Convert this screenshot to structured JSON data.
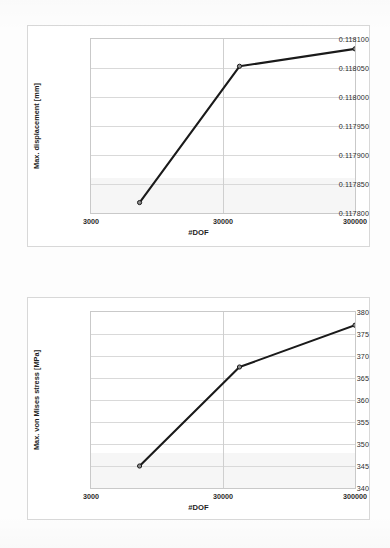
{
  "page": {
    "background_color": "#fdfdfd",
    "line_color": "#1a1a1a",
    "gridline_color": "#d9d9d9",
    "marker_fill": "#8d8d8d"
  },
  "charts": [
    {
      "id": "chart-top",
      "yaxis_title": "Max. displacement [mm]",
      "xaxis_title": "#DOF",
      "yticks": [
        "0.118100",
        "0.118050",
        "0.118000",
        "0.117950",
        "0.117900",
        "0.117850",
        "0.117800"
      ],
      "xticks": [
        "3000",
        "30000",
        "300000"
      ]
    },
    {
      "id": "chart-bottom",
      "yaxis_title": "Max. von Mises stress [MPa]",
      "xaxis_title": "#DOF",
      "yticks": [
        "380",
        "375",
        "370",
        "365",
        "360",
        "355",
        "350",
        "345",
        "340"
      ],
      "xticks": [
        "3000",
        "30000",
        "300000"
      ]
    }
  ],
  "chart_data": [
    {
      "type": "line",
      "title": "",
      "xlabel": "#DOF",
      "ylabel": "Max. displacement [mm]",
      "xscale": "log",
      "xlim": [
        3000,
        300000
      ],
      "ylim": [
        0.1178,
        0.1181
      ],
      "ytick_values": [
        0.1181,
        0.11805,
        0.118,
        0.11795,
        0.1179,
        0.11785,
        0.1178
      ],
      "xtick_values": [
        3000,
        30000,
        300000
      ],
      "grid": true,
      "legend": "none",
      "series": [
        {
          "name": "Max. displacement",
          "x": [
            7000,
            40000,
            300000
          ],
          "values": [
            0.117818,
            0.118053,
            0.118083
          ]
        }
      ]
    },
    {
      "type": "line",
      "title": "",
      "xlabel": "#DOF",
      "ylabel": "Max. von Mises stress [MPa]",
      "xscale": "log",
      "xlim": [
        3000,
        300000
      ],
      "ylim": [
        340,
        380
      ],
      "ytick_values": [
        380,
        375,
        370,
        365,
        360,
        355,
        350,
        345,
        340
      ],
      "xtick_values": [
        3000,
        30000,
        300000
      ],
      "grid": true,
      "legend": "none",
      "series": [
        {
          "name": "Max. von Mises stress",
          "x": [
            7000,
            40000,
            300000
          ],
          "values": [
            345.0,
            367.5,
            377.0
          ]
        }
      ]
    }
  ]
}
